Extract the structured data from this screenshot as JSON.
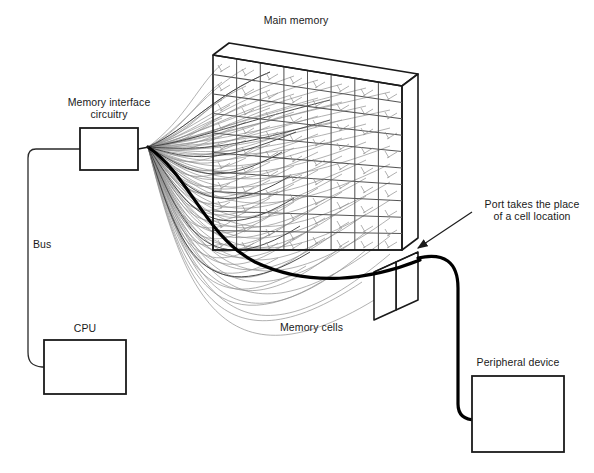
{
  "diagram": {
    "title_label": "Main memory",
    "labels": {
      "main_memory": "Main memory",
      "memory_interface": "Memory interface\ncircuitry",
      "memory_interface_line1": "Memory interface",
      "memory_interface_line2": "circuitry",
      "bus": "Bus",
      "cpu": "CPU",
      "memory_cells": "Memory cells",
      "port_note_line1": "Port takes the place",
      "port_note_line2": "of a cell location",
      "peripheral_device": "Peripheral device"
    },
    "colors": {
      "ink": "#1a1a1a",
      "wire_light": "#8a8a8a",
      "wire_mid": "#5a5a5a",
      "bold": "#000000",
      "background": "#ffffff"
    },
    "grid": {
      "columns": 8,
      "rows": 10,
      "description": "memory cells grid on front face of slab"
    },
    "boxes": {
      "memory_interface": {
        "x": 80,
        "y": 128,
        "w": 58,
        "h": 42
      },
      "cpu": {
        "x": 44,
        "y": 340,
        "w": 82,
        "h": 54
      },
      "peripheral_device": {
        "x": 472,
        "y": 376,
        "w": 92,
        "h": 76
      },
      "port": {
        "x": 396,
        "y": 262,
        "w": 22,
        "h": 48
      }
    }
  }
}
